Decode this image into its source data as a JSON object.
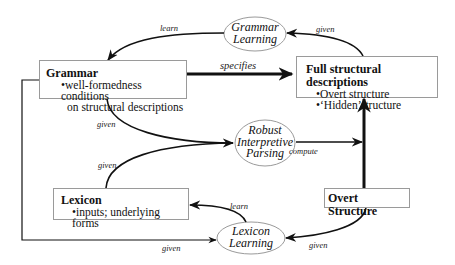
{
  "nodes": {
    "grammar": {
      "title": "Grammar",
      "items": [
        "•well-formedness conditions",
        "on structural descriptions"
      ]
    },
    "full_structural_descriptions": {
      "title": "Full structural descriptions",
      "items": [
        "•Overt structure",
        "•‘Hidden’structure"
      ]
    },
    "lexicon": {
      "title": "Lexicon",
      "items": [
        "•inputs; underlying forms"
      ]
    },
    "overt_structure": {
      "title": "Overt Structure"
    },
    "grammar_learning": {
      "lines": [
        "Grammar",
        "Learning"
      ]
    },
    "robust_interpretive_parsing": {
      "lines": [
        "Robust",
        "Interpretive",
        "Parsing"
      ]
    },
    "lexicon_learning": {
      "lines": [
        "Lexicon",
        "Learning"
      ]
    }
  },
  "edges": [
    {
      "from": "Grammar Learning",
      "to": "Grammar",
      "label": "learn"
    },
    {
      "from": "Full structural descriptions",
      "to": "Grammar Learning",
      "label": "given"
    },
    {
      "from": "Grammar",
      "to": "Full structural descriptions",
      "label": "specifies"
    },
    {
      "from": "Grammar",
      "to": "Robust Interpretive Parsing",
      "label": "given"
    },
    {
      "from": "Lexicon",
      "to": "Robust Interpretive Parsing",
      "label": "given"
    },
    {
      "from": "Robust Interpretive Parsing",
      "to": "Full structural descriptions",
      "label": "compute"
    },
    {
      "from": "Overt Structure",
      "to": "Full structural descriptions",
      "label": ""
    },
    {
      "from": "Lexicon Learning",
      "to": "Lexicon",
      "label": "learn"
    },
    {
      "from": "Overt Structure",
      "to": "Lexicon Learning",
      "label": "given"
    },
    {
      "from": "Grammar",
      "to": "Lexicon Learning",
      "label": "given"
    }
  ]
}
